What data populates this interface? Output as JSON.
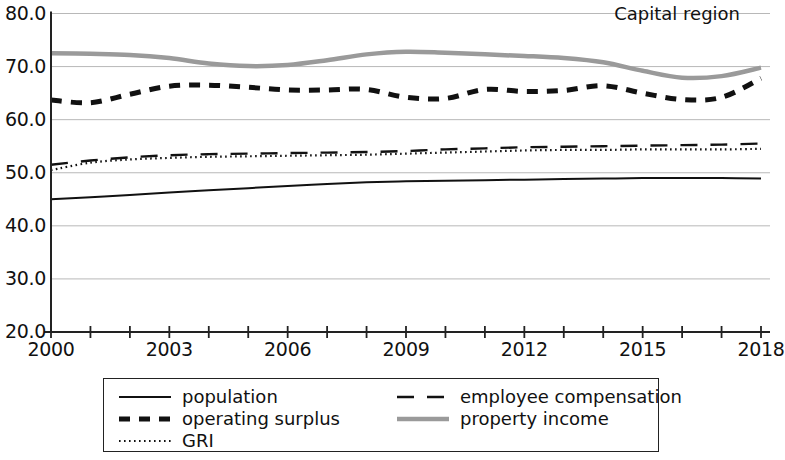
{
  "chart_data": {
    "type": "line",
    "title": "Capital region",
    "xlabel": "",
    "ylabel": "",
    "xlim": [
      2000,
      2018
    ],
    "ylim": [
      20.0,
      80.0
    ],
    "grid": "horizontal",
    "legend_position": "below",
    "x": [
      2000,
      2001,
      2002,
      2003,
      2004,
      2005,
      2006,
      2007,
      2008,
      2009,
      2010,
      2011,
      2012,
      2013,
      2014,
      2015,
      2016,
      2017,
      2018
    ],
    "xticks": [
      2000,
      2001,
      2002,
      2003,
      2004,
      2005,
      2006,
      2007,
      2008,
      2009,
      2010,
      2011,
      2012,
      2013,
      2014,
      2015,
      2016,
      2017,
      2018
    ],
    "xtick_labels": [
      "2000",
      "",
      "",
      "2003",
      "",
      "",
      "2006",
      "",
      "",
      "2009",
      "",
      "",
      "2012",
      "",
      "",
      "2015",
      "",
      "",
      "2018"
    ],
    "yticks": [
      20.0,
      30.0,
      40.0,
      50.0,
      60.0,
      70.0,
      80.0
    ],
    "ytick_labels": [
      "20.0",
      "30.0",
      "40.0",
      "50.0",
      "60.0",
      "70.0",
      "80.0"
    ],
    "series": [
      {
        "name": "population",
        "style": "solid",
        "color": "#111111",
        "width": 2.0,
        "values": [
          45.0,
          45.4,
          45.8,
          46.3,
          46.7,
          47.1,
          47.5,
          47.9,
          48.2,
          48.4,
          48.5,
          48.6,
          48.7,
          48.8,
          48.9,
          49.0,
          49.0,
          49.0,
          48.9
        ]
      },
      {
        "name": "operating surplus",
        "style": "dashed-thick",
        "color": "#111111",
        "width": 5.0,
        "values": [
          63.7,
          63.2,
          64.8,
          66.3,
          66.5,
          66.1,
          65.6,
          65.6,
          65.7,
          64.2,
          64.0,
          65.7,
          65.3,
          65.5,
          66.4,
          65.0,
          63.8,
          64.2,
          67.8
        ]
      },
      {
        "name": "GRI",
        "style": "dotted",
        "color": "#111111",
        "width": 2.2,
        "values": [
          50.5,
          51.9,
          52.5,
          52.8,
          53.0,
          53.1,
          53.2,
          53.3,
          53.4,
          53.6,
          53.8,
          54.0,
          54.2,
          54.3,
          54.3,
          54.4,
          54.4,
          54.4,
          54.5
        ]
      },
      {
        "name": "employee compensation",
        "style": "dashed-long",
        "color": "#111111",
        "width": 2.4,
        "values": [
          51.5,
          52.3,
          52.9,
          53.3,
          53.5,
          53.6,
          53.7,
          53.8,
          53.9,
          54.1,
          54.4,
          54.6,
          54.8,
          54.9,
          55.0,
          55.1,
          55.2,
          55.3,
          55.5
        ]
      },
      {
        "name": "property income",
        "style": "solid-thick-gray",
        "color": "#9a9a9a",
        "width": 4.5,
        "values": [
          72.5,
          72.4,
          72.2,
          71.6,
          70.6,
          70.1,
          70.3,
          71.2,
          72.3,
          72.8,
          72.6,
          72.3,
          72.0,
          71.6,
          70.8,
          69.2,
          67.9,
          68.2,
          69.8
        ]
      }
    ]
  },
  "legend": {
    "entries": [
      {
        "label": "population",
        "sample": "solid-line-sample"
      },
      {
        "label": "operating surplus",
        "sample": "thick-dashed-line-sample"
      },
      {
        "label": "GRI",
        "sample": "dotted-line-sample"
      },
      {
        "label": "employee compensation",
        "sample": "long-dashed-line-sample"
      },
      {
        "label": "property income",
        "sample": "thick-gray-line-sample"
      }
    ]
  }
}
